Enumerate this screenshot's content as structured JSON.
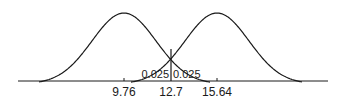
{
  "diagram": {
    "type": "two-normal-distributions",
    "colors": {
      "line": "#1a1a1a",
      "background": "#ffffff"
    },
    "axis": {
      "ticks": [
        {
          "value": 9.76,
          "label": "9.76"
        },
        {
          "value": 12.7,
          "label": "12.7"
        },
        {
          "value": 15.64,
          "label": "15.64"
        }
      ]
    },
    "curves": [
      {
        "name": "left-distribution",
        "mean": 9.76
      },
      {
        "name": "right-distribution",
        "mean": 15.64
      }
    ],
    "critical_value": {
      "value": 12.7,
      "label": "12.7"
    },
    "tail_areas": [
      {
        "side": "left",
        "label": "0.025"
      },
      {
        "side": "right",
        "label": "0.025"
      }
    ]
  }
}
